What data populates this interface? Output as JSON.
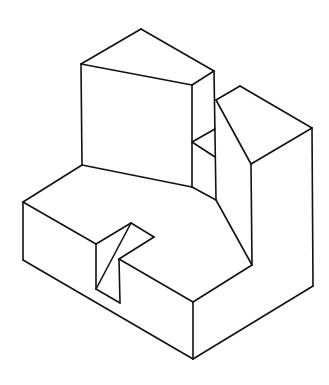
{
  "figure": {
    "type": "isometric line drawing",
    "width": 329,
    "height": 385,
    "stroke_color": "#111111",
    "background": "#ffffff",
    "edges": [
      {
        "part": "tall-block-top",
        "x1": 81,
        "y1": 64,
        "x2": 141,
        "y2": 29
      },
      {
        "part": "tall-block-top",
        "x1": 141,
        "y1": 29,
        "x2": 214,
        "y2": 71
      },
      {
        "part": "tall-block-top",
        "x1": 81,
        "y1": 64,
        "x2": 192,
        "y2": 85
      },
      {
        "part": "tall-block-top",
        "x1": 192,
        "y1": 85,
        "x2": 214,
        "y2": 71
      },
      {
        "part": "tall-block-front",
        "x1": 81,
        "y1": 64,
        "x2": 82,
        "y2": 165
      },
      {
        "part": "tall-block-front",
        "x1": 192,
        "y1": 85,
        "x2": 192,
        "y2": 187
      },
      {
        "part": "tall-block-front",
        "x1": 82,
        "y1": 165,
        "x2": 192,
        "y2": 187
      },
      {
        "part": "tall-block-side",
        "x1": 214,
        "y1": 71,
        "x2": 216,
        "y2": 200
      },
      {
        "part": "notch-step",
        "x1": 192,
        "y1": 142,
        "x2": 215,
        "y2": 129
      },
      {
        "part": "notch-step",
        "x1": 192,
        "y1": 142,
        "x2": 215,
        "y2": 157
      },
      {
        "part": "base-top",
        "x1": 192,
        "y1": 187,
        "x2": 216,
        "y2": 200
      },
      {
        "part": "right-block-top",
        "x1": 216,
        "y1": 100,
        "x2": 240,
        "y2": 86
      },
      {
        "part": "right-block-top",
        "x1": 240,
        "y1": 86,
        "x2": 312,
        "y2": 128
      },
      {
        "part": "right-block-top",
        "x1": 312,
        "y1": 128,
        "x2": 251,
        "y2": 164
      },
      {
        "part": "right-block-top",
        "x1": 216,
        "y1": 100,
        "x2": 251,
        "y2": 164
      },
      {
        "part": "right-block-slope",
        "x1": 216,
        "y1": 200,
        "x2": 252,
        "y2": 265
      },
      {
        "part": "right-block-front",
        "x1": 251,
        "y1": 164,
        "x2": 252,
        "y2": 265
      },
      {
        "part": "right-block-side",
        "x1": 312,
        "y1": 128,
        "x2": 313,
        "y2": 286
      },
      {
        "part": "base-top",
        "x1": 82,
        "y1": 165,
        "x2": 23,
        "y2": 202
      },
      {
        "part": "base-top",
        "x1": 23,
        "y1": 202,
        "x2": 96,
        "y2": 244
      },
      {
        "part": "base-left-side",
        "x1": 23,
        "y1": 202,
        "x2": 23,
        "y2": 260
      },
      {
        "part": "base-left-side",
        "x1": 23,
        "y1": 260,
        "x2": 193,
        "y2": 359
      },
      {
        "part": "slot",
        "x1": 96,
        "y1": 244,
        "x2": 131,
        "y2": 223
      },
      {
        "part": "slot",
        "x1": 131,
        "y1": 223,
        "x2": 154,
        "y2": 237
      },
      {
        "part": "slot",
        "x1": 154,
        "y1": 237,
        "x2": 119,
        "y2": 259
      },
      {
        "part": "slot",
        "x1": 131,
        "y1": 223,
        "x2": 96,
        "y2": 289
      },
      {
        "part": "slot",
        "x1": 96,
        "y1": 244,
        "x2": 96,
        "y2": 289
      },
      {
        "part": "slot",
        "x1": 119,
        "y1": 259,
        "x2": 120,
        "y2": 303
      },
      {
        "part": "slot",
        "x1": 96,
        "y1": 289,
        "x2": 120,
        "y2": 303
      },
      {
        "part": "base-front",
        "x1": 119,
        "y1": 259,
        "x2": 193,
        "y2": 302
      },
      {
        "part": "base-front",
        "x1": 193,
        "y1": 302,
        "x2": 252,
        "y2": 265
      },
      {
        "part": "base-corner",
        "x1": 193,
        "y1": 302,
        "x2": 193,
        "y2": 359
      },
      {
        "part": "base-right-side",
        "x1": 193,
        "y1": 359,
        "x2": 313,
        "y2": 286
      }
    ]
  }
}
